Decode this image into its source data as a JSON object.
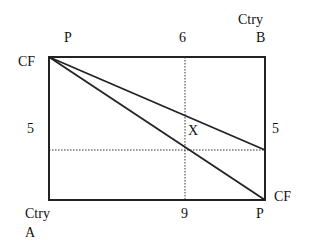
{
  "diagram": {
    "top_left_label": "P",
    "top_mid_label": "6",
    "top_right_label_line1": "Ctry",
    "top_right_label_line2": "B",
    "left_top_label": "CF",
    "left_mid_label": "5",
    "right_mid_label": "5",
    "right_bottom_label": "CF",
    "bottom_left_label_line1": "Ctry",
    "bottom_left_label_line2": "A",
    "bottom_mid_label": "9",
    "bottom_right_label": "P",
    "intersection_label": "X"
  }
}
